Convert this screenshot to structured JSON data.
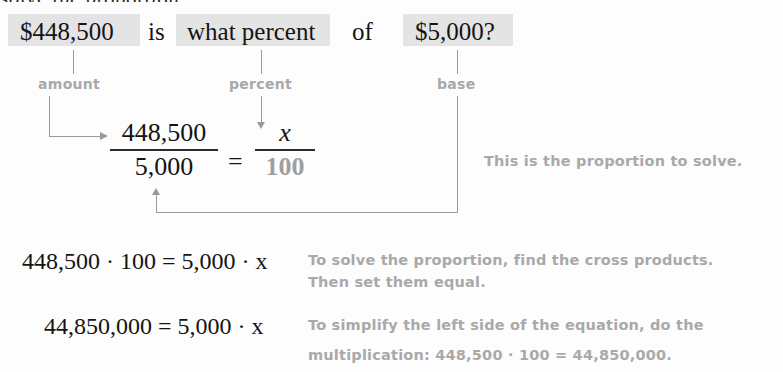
{
  "page": {
    "cut_off_heading": "solve the proportion.",
    "highlight_color": "#e4e4e4",
    "annotation_color": "#a9a9a9"
  },
  "question": {
    "amount_text": "$448,500",
    "is_text": "is",
    "percent_text": "what percent",
    "of_text": "of",
    "base_text": "$5,000?"
  },
  "labels": {
    "amount": "amount",
    "percent": "percent",
    "base": "base"
  },
  "proportion": {
    "left_numerator": "448,500",
    "left_denominator": "5,000",
    "equals": "=",
    "right_numerator": "x",
    "right_denominator": "100"
  },
  "steps": [
    {
      "equation": "448,500 · 100 = 5,000 · x",
      "note_line1": "To solve the proportion, find the cross products.",
      "note_line2": "Then set them equal."
    },
    {
      "equation": "44,850,000 = 5,000 · x",
      "note_line1": "To simplify the left side of the equation, do the",
      "note_line2": "multiplication: 448,500 · 100 = 44,850,000."
    }
  ],
  "notes": {
    "proportion_note": "This is the proportion to solve."
  }
}
